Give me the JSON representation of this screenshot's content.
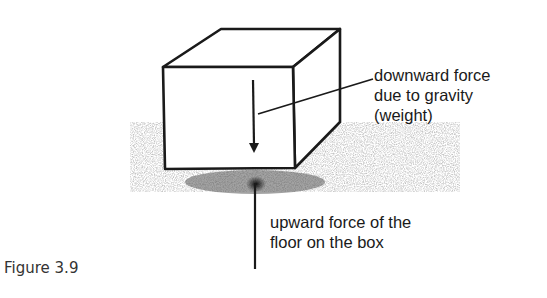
{
  "figure": {
    "caption": "Figure 3.9",
    "labels": {
      "weight_line1": "downward force",
      "weight_line2": "due to gravity",
      "weight_line3": "(weight)",
      "normal_line1": "upward force of the",
      "normal_line2": "floor on the box"
    },
    "colors": {
      "ink": "#1a1a1a",
      "floor_shadow": "#7a7a7a"
    }
  }
}
